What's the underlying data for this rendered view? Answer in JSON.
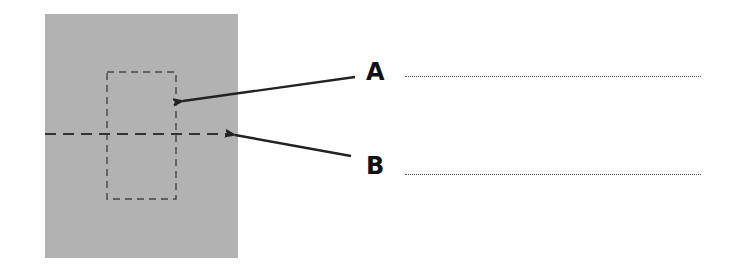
{
  "diagram": {
    "panel": {
      "color": "#b2b2b2"
    },
    "labels": [
      {
        "id": "A",
        "text": "A",
        "target": "inner dashed rectangle"
      },
      {
        "id": "B",
        "text": "B",
        "target": "horizontal dashed fold line"
      }
    ],
    "answer_lines": [
      {
        "for": "A",
        "value": ""
      },
      {
        "for": "B",
        "value": ""
      }
    ],
    "colors": {
      "arrow": "#222222",
      "dash": "#444444",
      "dotted": "#555555"
    }
  }
}
